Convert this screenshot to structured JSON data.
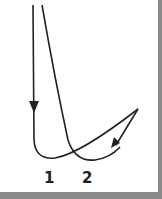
{
  "diagram": {
    "curves": [
      {
        "id": 1,
        "label": "1",
        "description": "vertical descent, sharp turn, rising to apex"
      },
      {
        "id": 2,
        "label": "2",
        "description": "curved descent, turn, rising to apex then returning with arrow"
      }
    ],
    "labels": {
      "curve1": "1",
      "curve2": "2"
    },
    "colors": {
      "stroke": "#222222",
      "background": "#ffffff",
      "frame": "#8a8a8a"
    }
  }
}
